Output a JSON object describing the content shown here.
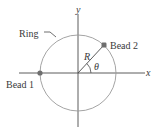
{
  "diagram": {
    "colors": {
      "background": "#ffffff",
      "axis": "#4a4a4a",
      "ring": "#9a9a9a",
      "bead": "#6e6e6e",
      "text": "#3a3a3a",
      "radius_line": "#4a4a4a"
    },
    "axes": {
      "x_label": "x",
      "y_label": "y"
    },
    "ring": {
      "label": "Ring",
      "center": [
        78,
        73
      ],
      "radius": 38
    },
    "radius_label": "R",
    "angle_label": "θ",
    "beads": [
      {
        "label": "Bead 1",
        "position": "on negative x-axis"
      },
      {
        "label": "Bead 2",
        "position": "upper-right on ring at angle θ"
      }
    ]
  }
}
